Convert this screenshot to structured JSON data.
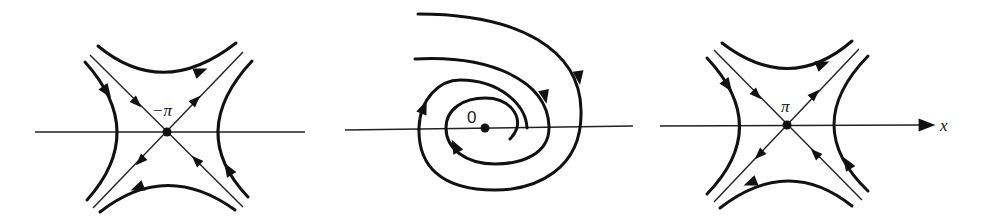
{
  "figure": {
    "type": "phase-portrait",
    "panels": [
      {
        "id": "saddle-left",
        "kind": "saddle",
        "equilibrium_label": "−π",
        "center": [
          167,
          132
        ]
      },
      {
        "id": "spiral-center",
        "kind": "stable-spiral",
        "equilibrium_label": "0",
        "center": [
          485,
          128
        ]
      },
      {
        "id": "saddle-right",
        "kind": "saddle",
        "equilibrium_label": "π",
        "center": [
          787,
          125
        ]
      }
    ],
    "axis": {
      "label": "x"
    },
    "colors": {
      "ink": "#111111",
      "background": "#ffffff"
    }
  }
}
